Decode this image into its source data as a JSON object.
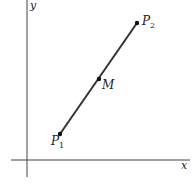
{
  "diagram": {
    "axes": {
      "x_label": "x",
      "y_label": "y"
    },
    "points": [
      {
        "name": "P",
        "subscript": "1",
        "role": "endpoint"
      },
      {
        "name": "M",
        "subscript": "",
        "role": "midpoint"
      },
      {
        "name": "P",
        "subscript": "2",
        "role": "endpoint"
      }
    ],
    "colors": {
      "line": "#333333",
      "axes": "#444444"
    }
  }
}
